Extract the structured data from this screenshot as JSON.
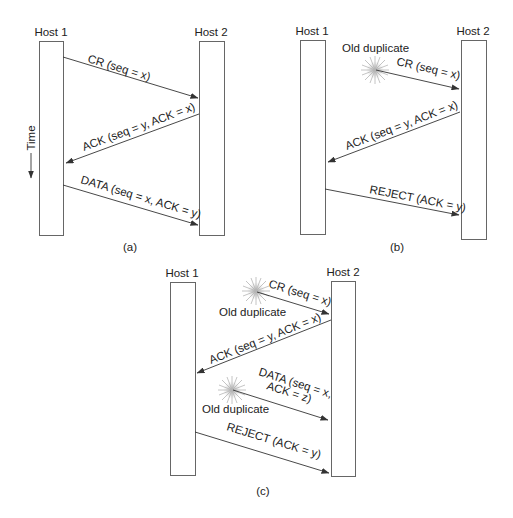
{
  "colors": {
    "line": "#333333",
    "box": "#666666",
    "burst": "#a8a8a8"
  },
  "panels": [
    {
      "caption": "(a)",
      "host1": "Host 1",
      "host2": "Host 2",
      "time_label": "Time",
      "messages": [
        {
          "label": "CR (seq = x)",
          "direction": "host1-to-host2"
        },
        {
          "label": "ACK (seq = y, ACK = x)",
          "direction": "host2-to-host1"
        },
        {
          "label": "DATA (seq = x, ACK = y)",
          "direction": "host1-to-host2"
        }
      ]
    },
    {
      "caption": "(b)",
      "host1": "Host 1",
      "host2": "Host 2",
      "old_duplicate": "Old duplicate",
      "messages": [
        {
          "label": "CR (seq = x)",
          "direction": "duplicate-to-host2"
        },
        {
          "label": "ACK (seq = y, ACK = x)",
          "direction": "host2-to-host1"
        },
        {
          "label": "REJECT (ACK = y)",
          "direction": "host1-to-host2"
        }
      ]
    },
    {
      "caption": "(c)",
      "host1": "Host 1",
      "host2": "Host 2",
      "old_duplicate_1": "Old duplicate",
      "old_duplicate_2": "Old duplicate",
      "messages": [
        {
          "label": "CR (seq = x)",
          "direction": "duplicate-to-host2"
        },
        {
          "label": "ACK (seq = y, ACK = x)",
          "direction": "host2-to-host1"
        },
        {
          "label_line1": "DATA (seq = x,",
          "label_line2": "ACK = z)",
          "direction": "duplicate-to-host2"
        },
        {
          "label": "REJECT (ACK = y)",
          "direction": "host1-to-host2"
        }
      ]
    }
  ]
}
